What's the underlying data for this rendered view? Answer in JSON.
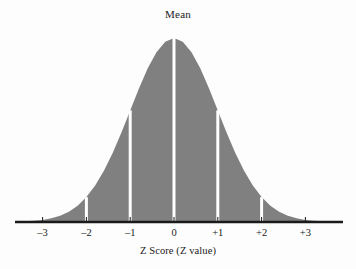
{
  "figure": {
    "title": "Mean",
    "background_color": "#fdfdfd",
    "curve_fill_color": "#808080",
    "axis_color": "#1a1a1a",
    "marker_color": "#ffffff"
  },
  "chart_data": {
    "type": "area",
    "title": "Mean",
    "xlabel": "Z Score (Z value)",
    "ylabel": "",
    "xlim": [
      -3.6,
      3.6
    ],
    "ylim": [
      0,
      1
    ],
    "grid": false,
    "legend": "none",
    "distribution": "standard normal",
    "mean": 0,
    "standard_deviation": 1,
    "tick_values": [
      -3,
      -2,
      -1,
      0,
      1,
      2,
      3
    ],
    "tick_labels": [
      "–3",
      "–2",
      "–1",
      "0",
      "+1",
      "+2",
      "+3"
    ],
    "annotations": [
      {
        "label": "Mean",
        "z": 0,
        "position": "top-center"
      }
    ],
    "marker_lines": [
      {
        "z": -2,
        "density": 0.135
      },
      {
        "z": -1,
        "density": 0.607
      },
      {
        "z": 0,
        "density": 1.0
      },
      {
        "z": 1,
        "density": 0.607
      },
      {
        "z": 2,
        "density": 0.135
      }
    ],
    "curve_points_x": [
      -3.6,
      -3.4,
      -3.2,
      -3.0,
      -2.8,
      -2.6,
      -2.4,
      -2.2,
      -2.0,
      -1.8,
      -1.6,
      -1.4,
      -1.2,
      -1.0,
      -0.8,
      -0.6,
      -0.4,
      -0.2,
      0.0,
      0.2,
      0.4,
      0.6,
      0.8,
      1.0,
      1.2,
      1.4,
      1.6,
      1.8,
      2.0,
      2.2,
      2.4,
      2.6,
      2.8,
      3.0,
      3.2,
      3.4,
      3.6
    ],
    "curve_points_y": [
      0.0015,
      0.0034,
      0.0063,
      0.0111,
      0.0198,
      0.034,
      0.0561,
      0.0889,
      0.1353,
      0.1979,
      0.278,
      0.3753,
      0.4868,
      0.6065,
      0.7261,
      0.8353,
      0.9231,
      0.9802,
      1.0,
      0.9802,
      0.9231,
      0.8353,
      0.7261,
      0.6065,
      0.4868,
      0.3753,
      0.278,
      0.1979,
      0.1353,
      0.0889,
      0.0561,
      0.034,
      0.0198,
      0.0111,
      0.0063,
      0.0034,
      0.0015
    ]
  },
  "axis": {
    "ticks": [
      {
        "label": "–3",
        "z": -3
      },
      {
        "label": "–2",
        "z": -2
      },
      {
        "label": "–1",
        "z": -1
      },
      {
        "label": "0",
        "z": 0
      },
      {
        "label": "+1",
        "z": 1
      },
      {
        "label": "+2",
        "z": 2
      },
      {
        "label": "+3",
        "z": 3
      }
    ],
    "label": "Z Score (Z value)"
  }
}
